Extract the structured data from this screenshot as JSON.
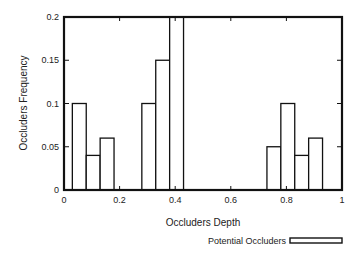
{
  "chart_data": {
    "type": "bar",
    "title": "",
    "xlabel": "Occluders Depth",
    "ylabel": "Occluders Frequency",
    "xlim": [
      0,
      1
    ],
    "ylim": [
      0,
      0.2
    ],
    "x_ticks": [
      "0",
      "0.2",
      "0.4",
      "0.6",
      "0.8",
      "1"
    ],
    "y_ticks": [
      "0",
      "0.05",
      "0.1",
      "0.15",
      "0.2"
    ],
    "grid": false,
    "legend": {
      "position": "bottom-right",
      "entries": [
        "Potential Occluders"
      ]
    },
    "series": [
      {
        "name": "Potential Occluders",
        "bins": [
          {
            "x0": 0.03,
            "x1": 0.08,
            "value": 0.1
          },
          {
            "x0": 0.08,
            "x1": 0.13,
            "value": 0.04
          },
          {
            "x0": 0.13,
            "x1": 0.18,
            "value": 0.06
          },
          {
            "x0": 0.28,
            "x1": 0.33,
            "value": 0.1
          },
          {
            "x0": 0.33,
            "x1": 0.38,
            "value": 0.15
          },
          {
            "x0": 0.38,
            "x1": 0.43,
            "value": 0.2
          },
          {
            "x0": 0.73,
            "x1": 0.78,
            "value": 0.05
          },
          {
            "x0": 0.78,
            "x1": 0.83,
            "value": 0.1
          },
          {
            "x0": 0.83,
            "x1": 0.88,
            "value": 0.04
          },
          {
            "x0": 0.88,
            "x1": 0.93,
            "value": 0.06
          }
        ]
      }
    ]
  }
}
